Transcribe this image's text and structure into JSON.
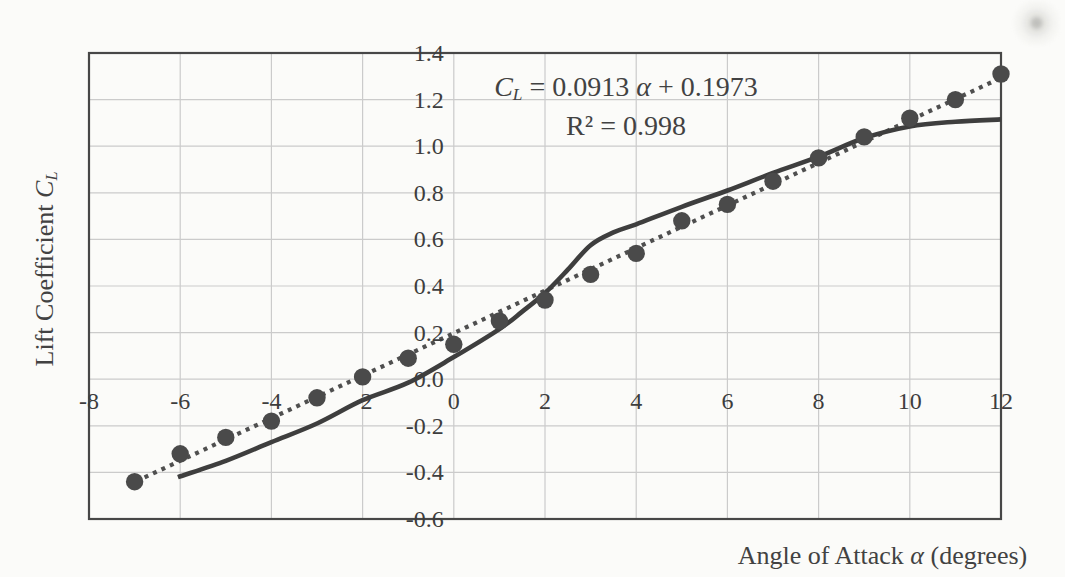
{
  "chart_data": {
    "type": "scatter",
    "title": "",
    "xlabel": "Angle of Attack α (degrees)",
    "ylabel": "Lift Coefficient CL",
    "xlabel_parts": {
      "prefix": "Angle of Attack ",
      "symbol": "α",
      "suffix": " (degrees)"
    },
    "ylabel_parts": {
      "prefix": "Lift Coefficient ",
      "symbol": "C",
      "subscript": "L"
    },
    "annotation": {
      "fit_var": "C",
      "fit_var_sub": "L",
      "fit_mid": " = 0.0913 ",
      "fit_symbol": "α",
      "fit_tail": " + 0.1973",
      "r_squared": "R² = 0.998"
    },
    "xlim": [
      -8,
      12
    ],
    "ylim": [
      -0.6,
      1.4
    ],
    "x_ticks": [
      "-8",
      "-6",
      "-4",
      "-2",
      "0",
      "2",
      "4",
      "6",
      "8",
      "10",
      "12"
    ],
    "y_ticks": [
      "1.4",
      "1.2",
      "1.0",
      "0.8",
      "0.6",
      "0.4",
      "0.2",
      "0.0",
      "-0.2",
      "-0.4",
      "-0.6"
    ],
    "grid": true,
    "legend": "none",
    "series": [
      {
        "name": "measured-lift-points",
        "plot": "scatter",
        "marker": "circle",
        "color": "#4a4a4a",
        "x": [
          -7,
          -6,
          -5,
          -4,
          -3,
          -2,
          -1,
          0,
          1,
          2,
          3,
          4,
          5,
          6,
          7,
          8,
          9,
          10,
          11,
          12
        ],
        "y": [
          -0.44,
          -0.32,
          -0.25,
          -0.18,
          -0.08,
          0.01,
          0.09,
          0.15,
          0.25,
          0.34,
          0.45,
          0.54,
          0.68,
          0.75,
          0.85,
          0.95,
          1.04,
          1.12,
          1.2,
          1.31
        ]
      },
      {
        "name": "linear-fit-trendline",
        "plot": "line",
        "style": "dotted",
        "color": "#4f4f4f",
        "slope": 0.0913,
        "intercept": 0.1973,
        "x": [
          -7.15,
          12.05
        ],
        "y": [
          -0.455,
          1.298
        ]
      },
      {
        "name": "theory-curve",
        "plot": "line",
        "style": "solid",
        "color": "#3e3e3e",
        "x": [
          -6.05,
          -5,
          -4,
          -3,
          -2,
          -1,
          0,
          1,
          1.5,
          2,
          2.5,
          3,
          3.5,
          4,
          5,
          6,
          7,
          8,
          9,
          10,
          11,
          12
        ],
        "y": [
          -0.42,
          -0.35,
          -0.27,
          -0.19,
          -0.09,
          -0.015,
          0.095,
          0.215,
          0.29,
          0.37,
          0.47,
          0.575,
          0.63,
          0.665,
          0.74,
          0.81,
          0.885,
          0.955,
          1.035,
          1.085,
          1.105,
          1.115
        ]
      }
    ],
    "colors": {
      "grid": "#cbcbcb",
      "border": "#474747",
      "text": "#3d3d3d",
      "background": "#fbfbf9"
    }
  }
}
